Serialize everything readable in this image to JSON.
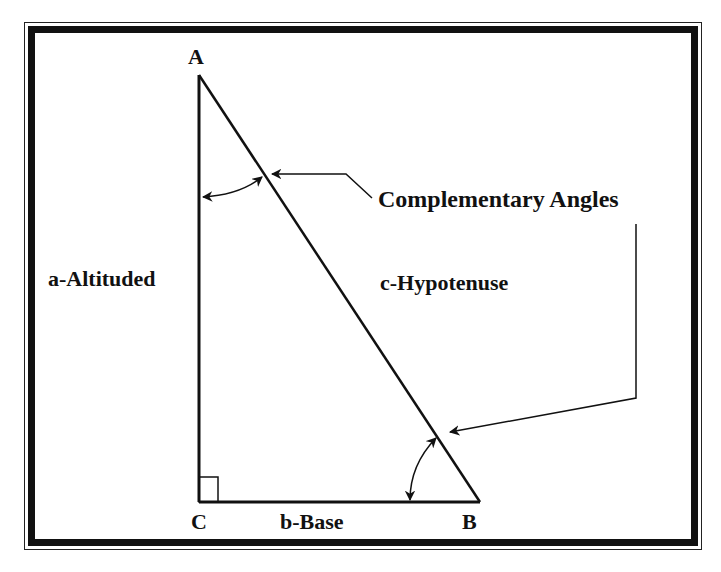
{
  "diagram": {
    "vertices": {
      "A": "A",
      "B": "B",
      "C": "C"
    },
    "labels": {
      "altitude": "a-Altituded",
      "hypotenuse": "c-Hypotenuse",
      "base": "b-Base",
      "complementary": "Complementary Angles"
    },
    "colors": {
      "stroke": "#111111",
      "background": "#ffffff"
    }
  }
}
